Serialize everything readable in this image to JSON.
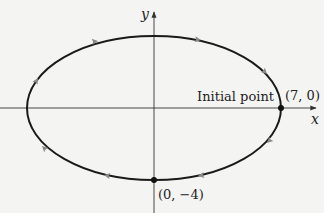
{
  "diagram": {
    "type": "parametric-ellipse",
    "axes": {
      "x_label": "x",
      "y_label": "y"
    },
    "ellipse": {
      "semi_major_x": 7,
      "semi_minor_y": 4,
      "direction": "clockwise"
    },
    "points": [
      {
        "label": "(7, 0)",
        "note": "Initial point"
      },
      {
        "label": "(0, −4)"
      }
    ],
    "annotations": {
      "initial_point": "Initial point"
    }
  },
  "colors": {
    "curve": "#1a1a1a",
    "axis": "#333333",
    "arrow": "#8a8a8a",
    "background": "#f4f4f3"
  }
}
